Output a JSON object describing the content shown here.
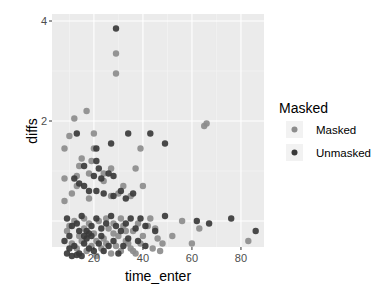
{
  "chart_data": {
    "type": "scatter",
    "title": "",
    "xlabel": "time_enter",
    "ylabel": "diffs",
    "xlim": [
      2.9,
      89.4
    ],
    "ylim": [
      -0.52,
      4.14
    ],
    "x_ticks": [
      20,
      40,
      60,
      80
    ],
    "y_ticks": [
      2,
      4
    ],
    "grid": true,
    "legend": {
      "title": "Masked",
      "position": "right",
      "entries": [
        "Masked",
        "Unmasked"
      ]
    },
    "colors": {
      "Masked": "#8c8c8c",
      "Unmasked": "#3a3a3a",
      "panel_bg": "#ebebeb",
      "grid": "#ffffff"
    },
    "series": [
      {
        "name": "Masked",
        "points": [
          [
            29,
            3.35
          ],
          [
            29,
            2.95
          ],
          [
            17,
            2.2
          ],
          [
            12,
            2.05
          ],
          [
            10,
            1.7
          ],
          [
            20,
            1.75
          ],
          [
            8,
            1.45
          ],
          [
            20,
            1.45
          ],
          [
            39,
            1.45
          ],
          [
            37,
            1.05
          ],
          [
            40,
            0.7
          ],
          [
            65,
            1.9
          ],
          [
            66,
            1.95
          ],
          [
            15,
            1.25
          ],
          [
            19,
            1.2
          ],
          [
            14,
            1.1
          ],
          [
            8,
            0.85
          ],
          [
            13,
            0.9
          ],
          [
            18,
            0.95
          ],
          [
            24,
            0.95
          ],
          [
            27,
            1.05
          ],
          [
            24,
            0.8
          ],
          [
            32,
            0.7
          ],
          [
            13,
            0.7
          ],
          [
            11,
            0.55
          ],
          [
            8,
            0.4
          ],
          [
            18,
            0.45
          ],
          [
            27,
            0.5
          ],
          [
            30,
            0.55
          ],
          [
            35,
            0.5
          ],
          [
            56,
            0.0
          ],
          [
            63,
            -0.15
          ],
          [
            60,
            -0.45
          ],
          [
            83,
            -0.4
          ],
          [
            52,
            -0.3
          ],
          [
            48,
            -0.45
          ],
          [
            47,
            -0.6
          ],
          [
            10,
            -0.1
          ],
          [
            12,
            0.0
          ],
          [
            14,
            -0.3
          ],
          [
            16,
            -0.15
          ],
          [
            18,
            -0.05
          ],
          [
            20,
            -0.25
          ],
          [
            22,
            0.0
          ],
          [
            24,
            -0.35
          ],
          [
            26,
            -0.15
          ],
          [
            28,
            -0.05
          ],
          [
            30,
            -0.3
          ],
          [
            32,
            -0.1
          ],
          [
            34,
            -0.45
          ],
          [
            36,
            -0.2
          ],
          [
            38,
            -0.05
          ],
          [
            40,
            -0.3
          ],
          [
            42,
            -0.1
          ],
          [
            44,
            -0.55
          ],
          [
            46,
            -0.35
          ],
          [
            11,
            -0.45
          ],
          [
            13,
            -0.55
          ],
          [
            15,
            -0.4
          ],
          [
            17,
            -0.6
          ],
          [
            19,
            -0.5
          ],
          [
            21,
            -0.7
          ],
          [
            23,
            -0.55
          ],
          [
            25,
            -0.45
          ],
          [
            27,
            -0.65
          ],
          [
            29,
            -0.5
          ],
          [
            31,
            -0.6
          ],
          [
            33,
            -0.4
          ],
          [
            35,
            -0.55
          ],
          [
            37,
            -0.65
          ],
          [
            9,
            -0.2
          ],
          [
            16,
            0.05
          ],
          [
            21,
            -0.4
          ],
          [
            25,
            0.05
          ],
          [
            33,
            -0.2
          ],
          [
            39,
            -0.45
          ],
          [
            43,
            0.05
          ],
          [
            45,
            -0.15
          ],
          [
            28,
            -0.25
          ],
          [
            31,
            0.05
          ],
          [
            36,
            -0.6
          ]
        ]
      },
      {
        "name": "Unmasked",
        "points": [
          [
            29,
            3.85
          ],
          [
            13,
            1.75
          ],
          [
            34,
            1.75
          ],
          [
            27,
            1.55
          ],
          [
            49,
            1.55
          ],
          [
            21,
            1.45
          ],
          [
            43,
            1.75
          ],
          [
            21,
            1.2
          ],
          [
            16,
            1.1
          ],
          [
            22,
            1.05
          ],
          [
            14,
            0.75
          ],
          [
            20,
            0.9
          ],
          [
            28,
            0.9
          ],
          [
            18,
            0.6
          ],
          [
            21,
            0.6
          ],
          [
            24,
            0.55
          ],
          [
            28,
            0.5
          ],
          [
            12,
            0.85
          ],
          [
            16,
            0.7
          ],
          [
            23,
            0.85
          ],
          [
            31,
            0.6
          ],
          [
            33,
            0.45
          ],
          [
            36,
            0.55
          ],
          [
            26,
            0.95
          ],
          [
            62,
            0.0
          ],
          [
            67,
            -0.05
          ],
          [
            76,
            0.05
          ],
          [
            86,
            -0.2
          ],
          [
            45,
            -0.2
          ],
          [
            49,
            0.1
          ],
          [
            9,
            0.05
          ],
          [
            11,
            -0.1
          ],
          [
            13,
            -0.05
          ],
          [
            15,
            0.1
          ],
          [
            17,
            -0.2
          ],
          [
            19,
            -0.1
          ],
          [
            21,
            0.05
          ],
          [
            23,
            -0.15
          ],
          [
            25,
            -0.05
          ],
          [
            27,
            0.1
          ],
          [
            29,
            -0.1
          ],
          [
            31,
            -0.2
          ],
          [
            33,
            -0.05
          ],
          [
            35,
            0.05
          ],
          [
            37,
            -0.15
          ],
          [
            39,
            0.05
          ],
          [
            41,
            -0.1
          ],
          [
            8,
            -0.4
          ],
          [
            10,
            -0.55
          ],
          [
            12,
            -0.5
          ],
          [
            14,
            -0.65
          ],
          [
            16,
            -0.45
          ],
          [
            18,
            -0.55
          ],
          [
            20,
            -0.6
          ],
          [
            22,
            -0.45
          ],
          [
            24,
            -0.6
          ],
          [
            26,
            -0.5
          ],
          [
            28,
            -0.4
          ],
          [
            30,
            -0.65
          ],
          [
            32,
            -0.5
          ],
          [
            34,
            -0.35
          ],
          [
            38,
            -0.4
          ],
          [
            41,
            -0.5
          ],
          [
            9,
            -0.65
          ],
          [
            11,
            -0.7
          ],
          [
            13,
            -0.68
          ],
          [
            15,
            -0.7
          ],
          [
            17,
            -0.35
          ],
          [
            19,
            -0.3
          ],
          [
            23,
            -0.3
          ],
          [
            10,
            -0.3
          ],
          [
            14,
            -0.2
          ],
          [
            16,
            -0.3
          ],
          [
            18,
            -0.25
          ]
        ]
      }
    ]
  }
}
